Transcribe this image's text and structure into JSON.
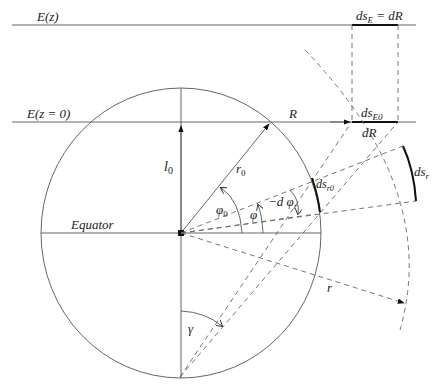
{
  "labels": {
    "ez": "E(z)",
    "ez0": "E(z = 0)",
    "ds_e_eq": "ds",
    "ds_e_sub": "E",
    "ds_e_rhs": " = dR",
    "ds_e0": "ds",
    "ds_e0_sub": "E0",
    "dR": "dR",
    "R": "R",
    "ds_r": "ds",
    "ds_r_sub": "r",
    "ds_r0": "ds",
    "ds_r0_sub": "r0",
    "l0": "l",
    "l0_sub": "0",
    "r0": "r",
    "r0_sub": "0",
    "phi0": "φ",
    "phi0_sub": "0",
    "phi": "φ",
    "dphi": "−d φ",
    "dphi_sub": "r",
    "equator": "Equator",
    "r": "r",
    "gamma": "γ"
  },
  "colors": {
    "line": "#555555",
    "dash": "#666666",
    "emphasis": "#111111",
    "background": "#ffffff"
  }
}
